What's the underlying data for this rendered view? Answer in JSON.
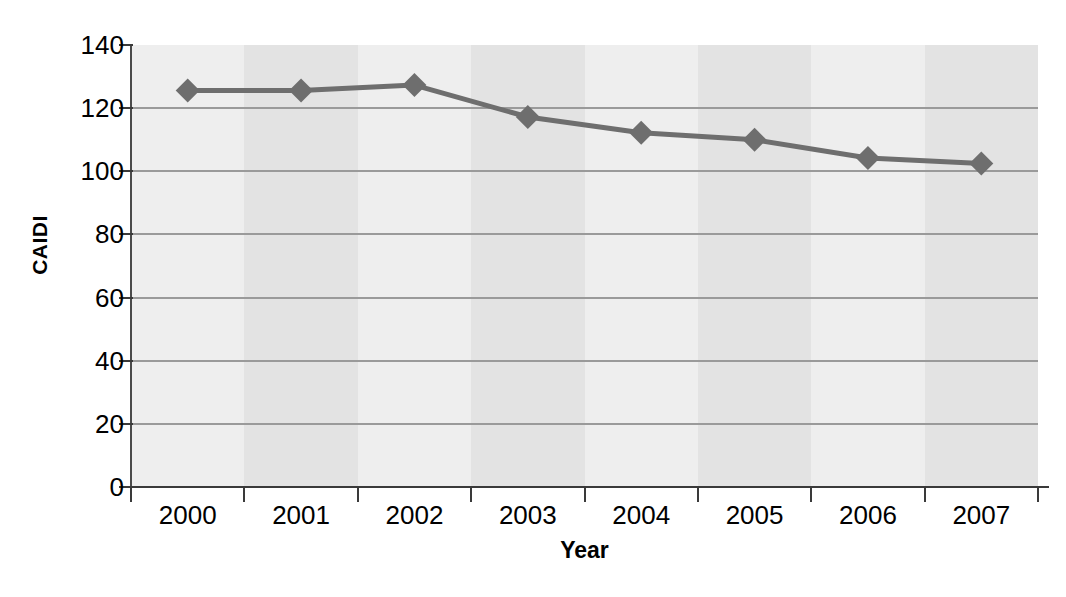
{
  "chart_data": {
    "type": "line",
    "title": "",
    "xlabel": "Year",
    "ylabel": "CAIDI",
    "categories": [
      "2000",
      "2001",
      "2002",
      "2003",
      "2004",
      "2005",
      "2006",
      "2007"
    ],
    "values": [
      125.6,
      125.6,
      127.3,
      117.2,
      112.2,
      110.0,
      104.2,
      102.5
    ],
    "series": [
      {
        "name": "CAIDI",
        "values": [
          125.6,
          125.6,
          127.3,
          117.2,
          112.2,
          110.0,
          104.2,
          102.5
        ],
        "color": "#6e6e6e",
        "marker": "diamond"
      }
    ],
    "ylim": [
      0,
      140
    ],
    "y_ticks": [
      0,
      20,
      40,
      60,
      80,
      100,
      120,
      140
    ],
    "y_tick_labels": [
      "0",
      "20",
      "40",
      "60",
      "80",
      "100",
      "120",
      "140"
    ],
    "grid": true,
    "grid_axis": "y",
    "legend": false,
    "legend_position": "none",
    "plot_background": "#ececec",
    "band_colors": [
      "#eeeeee",
      "#e3e3e3"
    ],
    "gridline_color": "#9a9a9a",
    "axis_color": "#3a3a3a"
  }
}
